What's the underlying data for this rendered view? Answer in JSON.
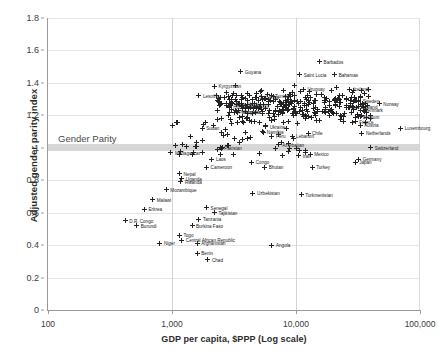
{
  "chart_data": {
    "type": "scatter",
    "title": "",
    "xlabel": "GDP per capita, $PPP (Log scale)",
    "ylabel": "Adjusted gender parity index",
    "xscale": "log",
    "xlim": [
      100,
      100000
    ],
    "ylim": [
      0,
      1.8
    ],
    "xticks": [
      "100",
      "1,000",
      "10,000",
      "100,000"
    ],
    "yticks": [
      "0",
      "0.2",
      "0.4",
      "0.6",
      "0.8",
      "1",
      "1.2",
      "1.4",
      "1.6",
      "1.8"
    ],
    "grid": "horizontal-and-vertical",
    "legend": "none",
    "annotations": [
      {
        "text": "Gender Parity",
        "y": 1.0,
        "x": 300,
        "style": "gray-band-at-y-1.0"
      }
    ],
    "accent_colors": {
      "marker": "#222222",
      "band": "#d0d0d0",
      "grid": "#e4e4e4",
      "axis": "#9a9a9a"
    },
    "points": [
      {
        "label": "Guyana",
        "x": 3600,
        "y": 1.47
      },
      {
        "label": "Barbados",
        "x": 15500,
        "y": 1.53
      },
      {
        "label": "Saint Lucia",
        "x": 10700,
        "y": 1.45
      },
      {
        "label": "Bahamas",
        "x": 20500,
        "y": 1.45
      },
      {
        "label": "Kyrgyzstan",
        "x": 2200,
        "y": 1.38
      },
      {
        "label": "Lesotho",
        "x": 1650,
        "y": 1.32
      },
      {
        "label": "Uruguay",
        "x": 11500,
        "y": 1.36
      },
      {
        "label": "Iceland",
        "x": 27000,
        "y": 1.36
      },
      {
        "label": "Sri Lanka",
        "x": 4700,
        "y": 1.31
      },
      {
        "label": "Tunisia",
        "x": 6300,
        "y": 1.32
      },
      {
        "label": "Sweden",
        "x": 32000,
        "y": 1.29
      },
      {
        "label": "Norway",
        "x": 47000,
        "y": 1.27
      },
      {
        "label": "Cape Verde",
        "x": 3000,
        "y": 1.27
      },
      {
        "label": "Honduras",
        "x": 2900,
        "y": 1.25
      },
      {
        "label": "Paraguay",
        "x": 3900,
        "y": 1.26
      },
      {
        "label": "Sudan",
        "x": 1750,
        "y": 1.12
      },
      {
        "label": "Guyana2",
        "x": 3650,
        "y": 1.3
      },
      {
        "label": "Philippines",
        "x": 3200,
        "y": 1.22
      },
      {
        "label": "Mongolia",
        "x": 3400,
        "y": 1.22
      },
      {
        "label": "New Zealand",
        "x": 25500,
        "y": 1.25
      },
      {
        "label": "Denmark",
        "x": 33000,
        "y": 1.23
      },
      {
        "label": "Belgium",
        "x": 32000,
        "y": 1.19
      },
      {
        "label": "France",
        "x": 30000,
        "y": 1.16
      },
      {
        "label": "Austria",
        "x": 33000,
        "y": 1.14
      },
      {
        "label": "Ukraine",
        "x": 5700,
        "y": 1.13
      },
      {
        "label": "Namibia",
        "x": 5400,
        "y": 1.1
      },
      {
        "label": "Chile",
        "x": 12500,
        "y": 1.09
      },
      {
        "label": "Netherlands",
        "x": 34000,
        "y": 1.09
      },
      {
        "label": "Peru",
        "x": 6400,
        "y": 1.07
      },
      {
        "label": "Lebanon",
        "x": 9300,
        "y": 1.07
      },
      {
        "label": "Luxembourg",
        "x": 70000,
        "y": 1.12
      },
      {
        "label": "Azerbaijan",
        "x": 7200,
        "y": 1.02
      },
      {
        "label": "Switzerland",
        "x": 40000,
        "y": 1.0
      },
      {
        "label": "Pakistan",
        "x": 2450,
        "y": 1.0
      },
      {
        "label": "Madagascar",
        "x": 980,
        "y": 0.97
      },
      {
        "label": "Iran",
        "x": 10500,
        "y": 0.95
      },
      {
        "label": "Mexico",
        "x": 13000,
        "y": 0.96
      },
      {
        "label": "Germany",
        "x": 32000,
        "y": 0.93
      },
      {
        "label": "Japan",
        "x": 30000,
        "y": 0.91
      },
      {
        "label": "Turkey",
        "x": 13500,
        "y": 0.88
      },
      {
        "label": "Laos",
        "x": 2100,
        "y": 0.93
      },
      {
        "label": "Cameroon",
        "x": 1900,
        "y": 0.88
      },
      {
        "label": "Nepal",
        "x": 1150,
        "y": 0.84
      },
      {
        "label": "Uganda",
        "x": 1200,
        "y": 0.81
      },
      {
        "label": "Rwanda",
        "x": 1180,
        "y": 0.79
      },
      {
        "label": "Bhutan",
        "x": 5600,
        "y": 0.88
      },
      {
        "label": "Congo",
        "x": 4400,
        "y": 0.91
      },
      {
        "label": "Mozambique",
        "x": 900,
        "y": 0.74
      },
      {
        "label": "Malawi",
        "x": 700,
        "y": 0.68
      },
      {
        "label": "Uzbekistan",
        "x": 4500,
        "y": 0.72
      },
      {
        "label": "Turkmenistan",
        "x": 11000,
        "y": 0.71
      },
      {
        "label": "Senegal",
        "x": 1900,
        "y": 0.63
      },
      {
        "label": "Tajikistan",
        "x": 2200,
        "y": 0.6
      },
      {
        "label": "Tanzania",
        "x": 1650,
        "y": 0.56
      },
      {
        "label": "Burkina Faso",
        "x": 1450,
        "y": 0.52
      },
      {
        "label": "Eritrea",
        "x": 600,
        "y": 0.62
      },
      {
        "label": "D.R. Congo",
        "x": 420,
        "y": 0.55
      },
      {
        "label": "Burundi",
        "x": 520,
        "y": 0.52
      },
      {
        "label": "Togo",
        "x": 1150,
        "y": 0.46
      },
      {
        "label": "Niger",
        "x": 800,
        "y": 0.41
      },
      {
        "label": "Central African Republic",
        "x": 1200,
        "y": 0.43
      },
      {
        "label": "Afghanistan",
        "x": 1600,
        "y": 0.41
      },
      {
        "label": "Benin",
        "x": 1600,
        "y": 0.35
      },
      {
        "label": "Chad",
        "x": 1950,
        "y": 0.31
      },
      {
        "label": "Angola",
        "x": 6400,
        "y": 0.4
      }
    ]
  }
}
